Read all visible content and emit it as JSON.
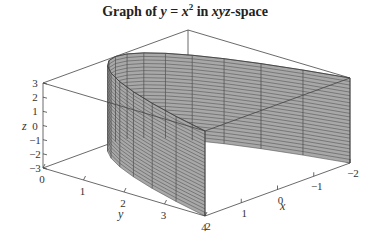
{
  "chart_data": {
    "type": "surface3d",
    "title_parts": {
      "pre": "Graph of ",
      "eq_y": "y",
      "eq_mid": " = ",
      "eq_x": "x",
      "eq_exp": "2",
      "mid": " in ",
      "space": "xyz",
      "post": "-space"
    },
    "equation": "y = x^2",
    "xlabel": "x",
    "ylabel": "y",
    "zlabel": "z",
    "xlim": [
      -2,
      2
    ],
    "ylim": [
      0,
      4
    ],
    "zlim": [
      -3,
      3
    ],
    "x_ticks": [
      2,
      1,
      0,
      -1,
      -2
    ],
    "x_tick_labels": [
      "2",
      "1",
      "0",
      "−1",
      "−2"
    ],
    "y_ticks": [
      0,
      1,
      2,
      3,
      4
    ],
    "y_tick_labels": [
      "0",
      "1",
      "2",
      "3",
      "4"
    ],
    "z_ticks": [
      3,
      2,
      1,
      0,
      -1,
      -2,
      -3
    ],
    "z_tick_labels": [
      "3",
      "2",
      "1",
      "0",
      "−1",
      "−2",
      "−3"
    ],
    "mesh": {
      "x_divisions": 16,
      "z_divisions": 24
    },
    "colors": {
      "surface": "#a8a8a8",
      "mesh": "#3a3a3a",
      "box": "#444444"
    }
  }
}
